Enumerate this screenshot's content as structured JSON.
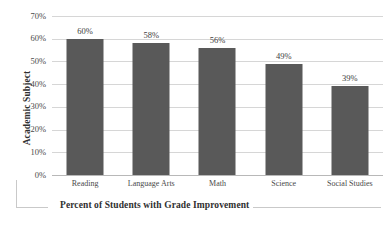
{
  "chart_data": {
    "type": "bar",
    "title": "",
    "categories": [
      "Reading",
      "Language Arts",
      "Math",
      "Science",
      "Social Studies"
    ],
    "values": [
      60,
      58,
      56,
      49,
      39
    ],
    "data_labels": [
      "60%",
      "58%",
      "56%",
      "49%",
      "39%"
    ],
    "xlabel": "Percent of Students with Grade Improvement",
    "ylabel": "Academic Subject",
    "ylim": [
      0,
      70
    ],
    "ytick_labels": [
      "70%",
      "60%",
      "50%",
      "40%",
      "30%",
      "20%",
      "10%",
      "0%"
    ],
    "ytick_values": [
      70,
      60,
      50,
      40,
      30,
      20,
      10,
      0
    ],
    "grid": true,
    "legend": "none",
    "bar_color": "#595959",
    "gridline_color": "#d6d6d6",
    "axis_color": "#b8b8b8",
    "text_color": "#3d3d3d"
  }
}
